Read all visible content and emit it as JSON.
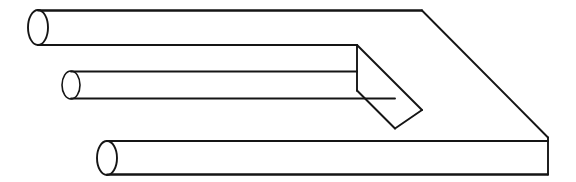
{
  "figure": {
    "kind": "line-drawing",
    "name": "impossible-trident",
    "alt_names": [
      "devils-fork",
      "blivet",
      "poiuyt"
    ],
    "style": "vintage engraving line art",
    "canvas": {
      "width": 576,
      "height": 182
    },
    "colors": {
      "background": "#ffffff",
      "ink": "#151515",
      "fill": "#ffffff"
    },
    "stroke_width": 1.9
  },
  "geometry": {
    "prongs": [
      {
        "id": "prong-top",
        "label": "top cylindrical prong",
        "cap_center": {
          "x": 38,
          "y": 27.5
        },
        "cap_rx": 10,
        "cap_ry": 17.5,
        "top_line": {
          "x1": 38,
          "y1": 10.5,
          "x2": 422,
          "y2": 10.5
        },
        "bottom_line": {
          "x1": 38,
          "y1": 45,
          "x2": 357,
          "y2": 45
        }
      },
      {
        "id": "prong-middle",
        "label": "middle cylindrical prong",
        "cap_center": {
          "x": 71,
          "y": 85
        },
        "cap_rx": 9,
        "cap_ry": 14,
        "top_line": {
          "x1": 71,
          "y1": 71.5,
          "x2": 357,
          "y2": 71.5
        },
        "bottom_line": {
          "x1": 71,
          "y1": 98.5,
          "x2": 395,
          "y2": 98.5
        }
      },
      {
        "id": "prong-bottom",
        "label": "bottom cylindrical prong",
        "cap_center": {
          "x": 107,
          "y": 158
        },
        "cap_rx": 10,
        "cap_ry": 17,
        "top_line": {
          "x1": 107,
          "y1": 141,
          "x2": 548,
          "y2": 141
        },
        "bottom_line": {
          "x1": 107,
          "y1": 174.5,
          "x2": 548,
          "y2": 174.5
        }
      }
    ],
    "base_block": {
      "id": "base-block",
      "label": "rectangular base slab",
      "top_edge": {
        "x1": 38,
        "y1": 10.5,
        "x2": 422,
        "y2": 10.5
      },
      "top_right_bevel": {
        "x1": 422,
        "y1": 10.5,
        "x2": 548,
        "y2": 137.5
      },
      "right_edge": {
        "x1": 548,
        "y1": 137.5,
        "x2": 548,
        "y2": 174.5
      },
      "bottom_edge": {
        "x1": 107,
        "y1": 174.5,
        "x2": 548,
        "y2": 174.5
      },
      "front_face_top": {
        "x1": 107,
        "y1": 141,
        "x2": 548,
        "y2": 141
      }
    },
    "slot": {
      "id": "slot-notch",
      "label": "interior rectangular notch between prongs",
      "vertical_edge": {
        "x1": 357,
        "y1": 45,
        "x2": 357,
        "y2": 90.5
      },
      "upper_diagonal": {
        "x1": 357,
        "y1": 45,
        "x2": 422,
        "y2": 110
      },
      "lower_diagonal": {
        "x1": 357,
        "y1": 90.5,
        "x2": 395,
        "y2": 128.5
      },
      "inner_shelf": {
        "x1": 395,
        "y1": 128.5,
        "x2": 422,
        "y2": 110
      }
    }
  },
  "accessibility": {
    "description": "Black-and-white line drawing of the impossible trident optical illusion: three round prongs on the left that merge into a flat two-pronged rectangular slab on the right."
  }
}
